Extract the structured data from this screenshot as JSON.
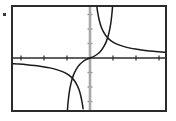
{
  "figure": {
    "name": "graph-figure",
    "width": 176,
    "height": 121,
    "background": "#ffffff",
    "border_color": "#2b2b2b",
    "border_width": 2,
    "frame": {
      "x": 11,
      "y": 5,
      "width": 156,
      "height": 107
    },
    "speck_artifact": {
      "x": 3,
      "y": 13,
      "width": 3,
      "height": 3,
      "color": "#3a3a3a"
    }
  },
  "axes": {
    "x_axis": {
      "name": "x-axis",
      "color": "#2b2b2b",
      "width": 1.4,
      "y": 58,
      "x_start": 13,
      "x_end": 165
    },
    "y_axis": {
      "name": "y-axis",
      "color": "#a8a8a8",
      "width": 2.6,
      "x": 90,
      "y_start": 7,
      "y_end": 110
    },
    "origin": {
      "x": 90,
      "y": 58
    },
    "unit_x": 23,
    "unit_y": 14.5,
    "x_ticks": [
      {
        "x": 21,
        "value": -3
      },
      {
        "x": 44,
        "value": -2
      },
      {
        "x": 67,
        "value": -1
      },
      {
        "x": 113,
        "value": 1
      },
      {
        "x": 136,
        "value": 2
      },
      {
        "x": 159,
        "value": 3
      }
    ],
    "y_ticks": [
      {
        "y": 14.5,
        "value": 3
      },
      {
        "y": 29,
        "value": 2
      },
      {
        "y": 43.5,
        "value": 1
      },
      {
        "y": 72.5,
        "value": -1
      },
      {
        "y": 87,
        "value": -2
      },
      {
        "y": 101.5,
        "value": -3
      }
    ],
    "tick_length_x": 5,
    "tick_length_y": 5,
    "tick_color_x": "#2b2b2b",
    "tick_color_y": "#8e8e8e"
  },
  "chart_data": {
    "type": "line",
    "title": "",
    "xlabel": "",
    "ylabel": "",
    "xlim": [
      -3.35,
      3.26
    ],
    "ylim": [
      -3.66,
      3.66
    ],
    "grid": false,
    "legend": null,
    "curve_color": "#1a1a1a",
    "curve_width": 1.5,
    "series": [
      {
        "name": "hyperbola-branch-upper-right",
        "description": "Reciprocal-type branch in quadrant I, descending from top, asymptotic to x-axis on the right",
        "x": [
          0.3,
          0.34,
          0.4,
          0.48,
          0.58,
          0.7,
          0.85,
          1.0,
          1.2,
          1.45,
          1.75,
          2.05,
          2.4,
          2.75,
          3.1,
          3.26
        ],
        "y": [
          3.5,
          3.1,
          2.62,
          2.18,
          1.82,
          1.52,
          1.27,
          1.1,
          0.94,
          0.8,
          0.68,
          0.6,
          0.52,
          0.46,
          0.42,
          0.4
        ]
      },
      {
        "name": "hyperbola-branch-lower-left",
        "description": "Reciprocal-type branch in quadrant III, asymptotic to x-axis on the left, plunging to bottom",
        "x": [
          -3.35,
          -3.1,
          -2.75,
          -2.4,
          -2.05,
          -1.75,
          -1.45,
          -1.2,
          -1.0,
          -0.85,
          -0.7,
          -0.58,
          -0.48,
          -0.4,
          -0.34,
          -0.3
        ],
        "y": [
          -0.4,
          -0.42,
          -0.46,
          -0.52,
          -0.6,
          -0.68,
          -0.8,
          -0.94,
          -1.1,
          -1.27,
          -1.52,
          -1.82,
          -2.18,
          -2.62,
          -3.1,
          -3.5
        ]
      },
      {
        "name": "steep-s-curve",
        "description": "Odd S-shaped curve through the origin, flat near x=0, rising steeply outward to top-right and bottom-left",
        "x": [
          -0.98,
          -0.95,
          -0.9,
          -0.82,
          -0.72,
          -0.6,
          -0.45,
          -0.3,
          -0.15,
          0.0,
          0.15,
          0.3,
          0.45,
          0.6,
          0.72,
          0.82,
          0.9,
          0.95,
          0.98
        ],
        "y": [
          -3.66,
          -3.0,
          -2.35,
          -1.7,
          -1.18,
          -0.78,
          -0.45,
          -0.24,
          -0.1,
          0.0,
          0.1,
          0.24,
          0.45,
          0.78,
          1.18,
          1.7,
          2.35,
          3.0,
          3.66
        ]
      }
    ],
    "intersections": [
      {
        "name": "upper-intersection",
        "x": 0.86,
        "y": 1.25
      },
      {
        "name": "lower-intersection",
        "x": -0.86,
        "y": -1.25
      }
    ]
  }
}
